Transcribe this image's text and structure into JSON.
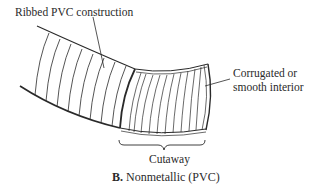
{
  "diagram": {
    "labels": {
      "ribbed": "Ribbed PVC construction",
      "corrugated_line1": "Corrugated or",
      "corrugated_line2": "smooth interior",
      "cutaway": "Cutaway"
    },
    "caption": {
      "letter": "B.",
      "text": " Nonmetallic (PVC)"
    },
    "colors": {
      "line": "#2a2a2a",
      "background": "#ffffff"
    }
  }
}
